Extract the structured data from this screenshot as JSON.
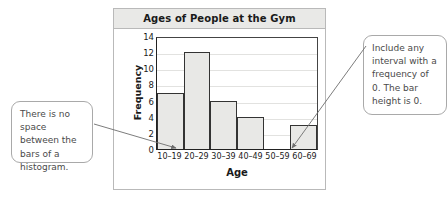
{
  "chart_data": {
    "type": "bar",
    "title": "Ages of People at the Gym",
    "xlabel": "Age",
    "ylabel": "Frequency",
    "categories": [
      "10–19",
      "20–29",
      "30–39",
      "40–49",
      "50–59",
      "60–69"
    ],
    "values": [
      7,
      12,
      6,
      4,
      0,
      3
    ],
    "ylim": [
      0,
      14
    ],
    "yticks": [
      0,
      2,
      4,
      6,
      8,
      10,
      12,
      14
    ],
    "ytick_labels": [
      "0",
      "2",
      "4",
      "6",
      "8",
      "10",
      "12",
      "14"
    ],
    "grid": true,
    "legend": "none",
    "bar_gap": 0,
    "bar_fill": "#e8e8e6",
    "bar_stroke": "#333333"
  },
  "panel": {
    "title": "Ages of People at the Gym",
    "title_band_color": "#e9e9e7",
    "border_color": "#b9b9b9"
  },
  "axes": {
    "y_title": "Frequency",
    "x_title": "Age",
    "y_tick_labels": [
      "14",
      "12",
      "10",
      "8",
      "6",
      "4",
      "2",
      "0"
    ],
    "x_tick_labels": [
      "10–19",
      "20–29",
      "30–39",
      "40–49",
      "50–59",
      "60–69"
    ]
  },
  "callouts": {
    "left": {
      "text": "There is no space between the bars of a histogram.",
      "border_color": "#a9a9a9",
      "text_color": "#4a4a4a"
    },
    "right": {
      "text": "Include any interval with a frequency of 0. The bar height is 0.",
      "border_color": "#a9a9a9",
      "text_color": "#4a4a4a"
    }
  }
}
